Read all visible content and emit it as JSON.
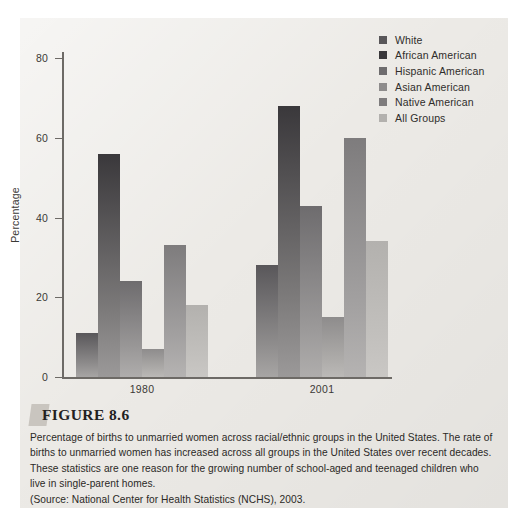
{
  "figure": {
    "tab_icon": "figure-tab-icon",
    "title": "FIGURE 8.6",
    "caption_body": "Percentage of births to unmarried women across racial/ethnic groups in the United States. The rate of births to unmarried women has increased across all groups in the United States over recent decades. These statistics are one reason for the growing number of school-aged and teenaged children who live in single-parent homes.",
    "caption_source": "(Source: National Center for Health Statistics (NCHS), 2003."
  },
  "chart_data": {
    "type": "bar",
    "title": "",
    "xlabel": "",
    "ylabel": "Percentage",
    "categories": [
      "1980",
      "2001"
    ],
    "ylim": [
      0,
      80
    ],
    "yticks": [
      0,
      20,
      40,
      60,
      80
    ],
    "ytick_labels": [
      "0",
      "20",
      "40",
      "60",
      "80"
    ],
    "grid": false,
    "legend_position": "top-right",
    "series": [
      {
        "name": "White",
        "values": [
          11,
          28
        ],
        "color": "#59575a"
      },
      {
        "name": "African American",
        "values": [
          56,
          68
        ],
        "color": "#3a383b"
      },
      {
        "name": "Hispanic American",
        "values": [
          24,
          43
        ],
        "color": "#6e6c6e"
      },
      {
        "name": "Asian American",
        "values": [
          7,
          15
        ],
        "color": "#8e8c8c"
      },
      {
        "name": "Native American",
        "values": [
          33,
          60
        ],
        "color": "#7e7c7d"
      },
      {
        "name": "All Groups",
        "values": [
          18,
          34
        ],
        "color": "#b3b1ae"
      }
    ]
  }
}
